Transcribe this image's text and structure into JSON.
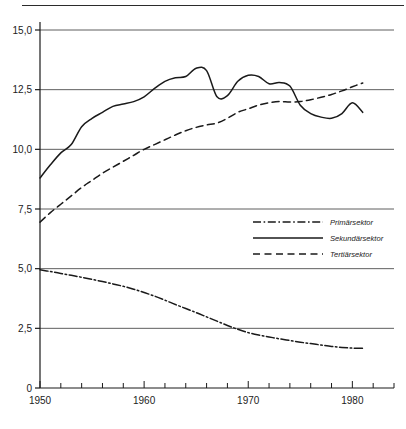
{
  "figure": {
    "name": "sector-employment-line-chart",
    "has_top_rule": true
  },
  "chart_data": {
    "type": "line",
    "title": "",
    "subtitle": "",
    "xlabel": "",
    "ylabel": "",
    "xlim": [
      1950,
      1984
    ],
    "ylim": [
      0,
      15
    ],
    "grid": true,
    "grid_axis": "y",
    "decimal_separator": ",",
    "legend_position": "center-right",
    "x_ticks_major": [
      "1950",
      "1960",
      "1970",
      "1980"
    ],
    "x_ticks_major_values": [
      1950,
      1960,
      1970,
      1980
    ],
    "x_tick_step_minor": 2,
    "y_ticks": [
      "0",
      "2,5",
      "5,0",
      "7,5",
      "10,0",
      "12,5",
      "15,0"
    ],
    "y_tick_values": [
      0,
      2.5,
      5.0,
      7.5,
      10.0,
      12.5,
      15.0
    ],
    "series": [
      {
        "name": "Primärsektor",
        "style": "dash-dot",
        "color": "#1a1a1a",
        "x": [
          1950,
          1951,
          1952,
          1953,
          1954,
          1955,
          1956,
          1957,
          1958,
          1959,
          1960,
          1961,
          1962,
          1963,
          1964,
          1965,
          1966,
          1967,
          1968,
          1969,
          1970,
          1971,
          1972,
          1973,
          1974,
          1975,
          1976,
          1977,
          1978,
          1979,
          1980,
          1981
        ],
        "values": [
          4.95,
          4.88,
          4.8,
          4.72,
          4.64,
          4.55,
          4.46,
          4.36,
          4.26,
          4.14,
          4.0,
          3.85,
          3.68,
          3.5,
          3.33,
          3.16,
          2.98,
          2.8,
          2.62,
          2.46,
          2.32,
          2.22,
          2.14,
          2.06,
          1.99,
          1.92,
          1.86,
          1.8,
          1.74,
          1.7,
          1.67,
          1.66
        ]
      },
      {
        "name": "Sekundärsektor",
        "style": "solid",
        "color": "#1a1a1a",
        "x": [
          1950,
          1951,
          1952,
          1953,
          1954,
          1955,
          1956,
          1957,
          1958,
          1959,
          1960,
          1961,
          1962,
          1963,
          1964,
          1965,
          1966,
          1967,
          1968,
          1969,
          1970,
          1971,
          1972,
          1973,
          1974,
          1975,
          1976,
          1977,
          1978,
          1979,
          1980,
          1981
        ],
        "values": [
          8.8,
          9.35,
          9.85,
          10.2,
          10.95,
          11.3,
          11.55,
          11.8,
          11.9,
          12.0,
          12.2,
          12.55,
          12.85,
          13.0,
          13.05,
          13.4,
          13.3,
          12.2,
          12.25,
          12.85,
          13.1,
          13.05,
          12.75,
          12.8,
          12.65,
          11.85,
          11.5,
          11.35,
          11.3,
          11.5,
          11.95,
          11.55
        ]
      },
      {
        "name": "Tertiärsektor",
        "style": "dashed",
        "color": "#1a1a1a",
        "x": [
          1950,
          1951,
          1952,
          1953,
          1954,
          1955,
          1956,
          1957,
          1958,
          1959,
          1960,
          1961,
          1962,
          1963,
          1964,
          1965,
          1966,
          1967,
          1968,
          1969,
          1970,
          1971,
          1972,
          1973,
          1974,
          1975,
          1976,
          1977,
          1978,
          1979,
          1980,
          1981
        ],
        "values": [
          6.95,
          7.35,
          7.7,
          8.05,
          8.4,
          8.7,
          9.0,
          9.25,
          9.5,
          9.75,
          10.0,
          10.2,
          10.4,
          10.6,
          10.78,
          10.92,
          11.02,
          11.1,
          11.3,
          11.55,
          11.7,
          11.85,
          11.95,
          12.0,
          11.98,
          12.0,
          12.08,
          12.18,
          12.3,
          12.45,
          12.62,
          12.78
        ]
      }
    ]
  },
  "legend": {
    "items": [
      {
        "label": "Primärsektor",
        "style": "dash-dot"
      },
      {
        "label": "Sekundärsektor",
        "style": "solid"
      },
      {
        "label": "Tertiärsektor",
        "style": "dashed"
      }
    ]
  }
}
